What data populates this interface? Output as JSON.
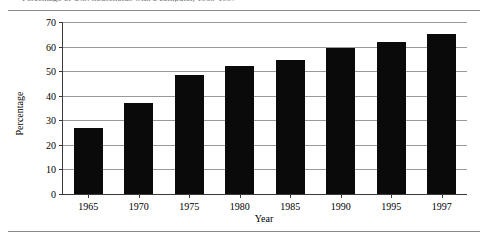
{
  "figure": {
    "caption_remnant": "Percentage of U.S. households with a computer, 1965-1997"
  },
  "chart_data": {
    "type": "bar",
    "title": "",
    "xlabel": "Year",
    "ylabel": "Percentage",
    "categories": [
      "1965",
      "1970",
      "1975",
      "1980",
      "1985",
      "1990",
      "1995",
      "1997"
    ],
    "values": [
      27,
      37,
      48.5,
      52,
      54.5,
      59.5,
      62,
      65
    ],
    "ylim": [
      0,
      70
    ],
    "yticks": [
      0,
      10,
      20,
      30,
      40,
      50,
      60,
      70
    ],
    "ytick_labels": [
      "0",
      "10",
      "20",
      "30",
      "40",
      "50",
      "60",
      "70"
    ],
    "grid": true,
    "legend": false,
    "bar_color": "#0a0a0a"
  }
}
